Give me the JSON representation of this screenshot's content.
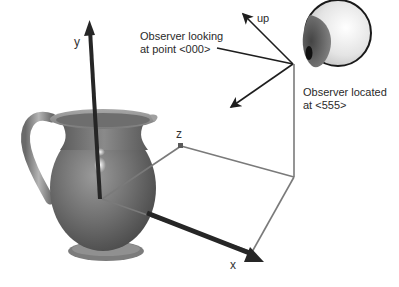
{
  "diagram": {
    "type": "3d-viewing-coordinate-system",
    "axes": {
      "x_label": "x",
      "y_label": "y",
      "z_label": "z"
    },
    "vectors": {
      "up_label": "up"
    },
    "annotations": {
      "look_at_line1": "Observer looking",
      "look_at_line2": "at point <000>",
      "observer_line1": "Observer located",
      "observer_line2": "at <555>"
    },
    "objects": {
      "scene_object": "pitcher",
      "observer_icon": "eyeball"
    },
    "colors": {
      "axis_arrow": "#262626",
      "box_lines": "#7a7a7a",
      "pitcher_body": "#6e6e6e",
      "eye_iris": "#555555",
      "eye_pupil": "#111111",
      "text": "#2a2a2a"
    }
  }
}
